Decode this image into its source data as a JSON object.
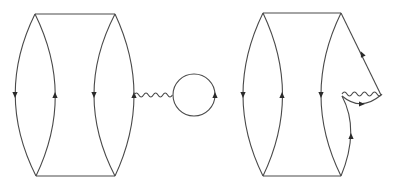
{
  "figure": {
    "type": "feynman-diagrams",
    "panels": [
      {
        "id": "left",
        "description": "Ladder with four fermion arcs; photon line from right arc to a closed fermion loop",
        "arc_arrows": [
          "down",
          "up",
          "down",
          "up"
        ],
        "attachments": [
          "wavy-photon",
          "closed-loop"
        ]
      },
      {
        "id": "right",
        "description": "Ladder with three arcs; right side has vertex correction with photon self-loop",
        "arc_arrows": [
          "down",
          "up",
          "down"
        ],
        "attachments": [
          "wavy-photon-vertex-correction"
        ]
      }
    ],
    "colors": {
      "line": "#4a4a4a",
      "arrow": "#2a2a2a",
      "background": "#ffffff"
    }
  }
}
